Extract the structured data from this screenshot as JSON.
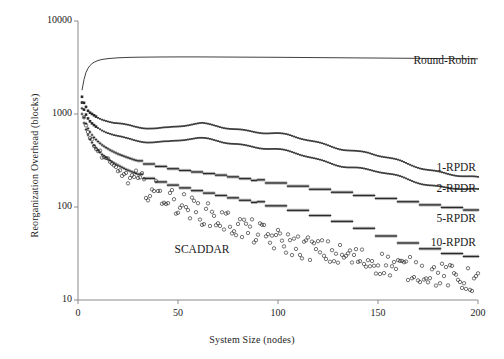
{
  "chart_data": {
    "type": "scatter",
    "title": "",
    "xlabel": "System Size (nodes)",
    "ylabel": "Reorganization Overhead (blocks)",
    "xlim": [
      0,
      200
    ],
    "ylim": [
      10,
      10000
    ],
    "yscale": "log",
    "xscale": "linear",
    "grid": false,
    "legend_position": "inline-right",
    "xticks": [
      0,
      50,
      100,
      150,
      200
    ],
    "xtick_labels": [
      "0",
      "50",
      "100",
      "150",
      "200"
    ],
    "yticks": [
      10,
      100,
      1000,
      10000
    ],
    "ytick_labels": [
      "10",
      "100",
      "1000",
      "10000"
    ],
    "series": [
      {
        "name": "Round-Robin",
        "marker": "line",
        "label_x": 208,
        "label_y": 3600,
        "x": [
          2,
          3,
          4,
          5,
          6,
          7,
          8,
          10,
          12,
          15,
          20,
          25,
          30,
          40,
          50,
          60,
          70,
          80,
          90,
          100,
          110,
          120,
          130,
          140,
          150,
          160,
          170,
          180,
          190,
          200
        ],
        "y": [
          1800,
          2350,
          2800,
          3100,
          3320,
          3480,
          3600,
          3760,
          3860,
          3940,
          4020,
          4060,
          4080,
          4100,
          4110,
          4110,
          4100,
          4090,
          4080,
          4070,
          4055,
          4040,
          4025,
          4010,
          3995,
          3980,
          3965,
          3950,
          3935,
          3920
        ]
      },
      {
        "name": "1-RPDR",
        "marker": "filled-square-small",
        "label_x": 204,
        "label_y": 255,
        "x": [
          2,
          3,
          4,
          5,
          6,
          7,
          8,
          9,
          10,
          12,
          14,
          16,
          18,
          20,
          24,
          28,
          32,
          36,
          40,
          45,
          50,
          55,
          60,
          62,
          65,
          70,
          75,
          80,
          85,
          90,
          95,
          100,
          105,
          110,
          115,
          120,
          125,
          130,
          135,
          140,
          145,
          150,
          155,
          160,
          165,
          170,
          175,
          180,
          185,
          190,
          195,
          200
        ],
        "y": [
          1500,
          1280,
          1150,
          1040,
          990,
          960,
          930,
          905,
          880,
          850,
          830,
          810,
          790,
          780,
          760,
          745,
          740,
          735,
          720,
          715,
          730,
          745,
          760,
          765,
          755,
          740,
          720,
          700,
          675,
          650,
          625,
          600,
          575,
          545,
          520,
          495,
          470,
          445,
          420,
          395,
          375,
          350,
          330,
          310,
          290,
          275,
          260,
          245,
          230,
          218,
          208,
          200
        ]
      },
      {
        "name": "2-RPDR",
        "marker": "filled-square-small",
        "label_x": 204,
        "label_y": 152,
        "x": [
          2,
          3,
          4,
          5,
          6,
          7,
          8,
          9,
          10,
          12,
          14,
          16,
          18,
          20,
          24,
          28,
          32,
          36,
          40,
          45,
          50,
          55,
          60,
          65,
          70,
          75,
          80,
          85,
          90,
          95,
          100,
          105,
          110,
          115,
          120,
          125,
          130,
          135,
          140,
          145,
          150,
          155,
          160,
          165,
          170,
          175,
          180,
          185,
          190,
          195,
          200
        ],
        "y": [
          1300,
          1080,
          950,
          860,
          800,
          760,
          730,
          705,
          685,
          650,
          625,
          605,
          585,
          570,
          545,
          530,
          525,
          520,
          512,
          505,
          515,
          525,
          530,
          525,
          515,
          500,
          485,
          465,
          445,
          425,
          405,
          385,
          365,
          345,
          325,
          308,
          292,
          276,
          262,
          248,
          235,
          222,
          210,
          198,
          188,
          178,
          170,
          163,
          158,
          152,
          148
        ]
      },
      {
        "name": "5-RPDR",
        "marker": "cross-dense",
        "label_x": 204,
        "label_y": 72,
        "x": [
          2,
          3,
          4,
          5,
          6,
          7,
          8,
          9,
          10,
          12,
          14,
          16,
          18,
          20,
          24,
          28,
          32,
          36,
          40,
          44,
          48,
          52,
          56,
          60,
          64,
          68,
          72,
          76,
          80,
          84,
          88,
          92,
          96,
          100,
          104,
          108,
          112,
          116,
          120,
          124,
          128,
          132,
          136,
          140,
          144,
          148,
          152,
          156,
          160,
          165,
          170,
          175,
          180,
          185,
          190,
          195,
          200
        ],
        "y": [
          1150,
          920,
          790,
          700,
          640,
          595,
          560,
          530,
          505,
          465,
          435,
          410,
          390,
          372,
          345,
          322,
          305,
          290,
          278,
          268,
          258,
          250,
          244,
          238,
          232,
          226,
          220,
          214,
          208,
          202,
          196,
          190,
          185,
          180,
          175,
          170,
          165,
          160,
          156,
          152,
          148,
          144,
          140,
          136,
          132,
          128,
          125,
          122,
          118,
          114,
          110,
          106,
          103,
          100,
          97,
          94,
          92
        ]
      },
      {
        "name": "10-RPDR",
        "marker": "cross-dense",
        "label_x": 204,
        "label_y": 40,
        "x": [
          2,
          3,
          4,
          5,
          6,
          7,
          8,
          9,
          10,
          12,
          14,
          16,
          18,
          20,
          24,
          28,
          32,
          36,
          40,
          44,
          48,
          52,
          56,
          60,
          64,
          68,
          72,
          76,
          80,
          84,
          88,
          92,
          96,
          100,
          104,
          108,
          112,
          116,
          120,
          124,
          128,
          132,
          136,
          140,
          145,
          150,
          155,
          160,
          165,
          170,
          175,
          180,
          185,
          190,
          195,
          200
        ],
        "y": [
          1000,
          800,
          680,
          595,
          535,
          492,
          458,
          430,
          406,
          368,
          340,
          316,
          297,
          281,
          254,
          234,
          217,
          203,
          191,
          181,
          172,
          164,
          157,
          150,
          144,
          138,
          133,
          128,
          123,
          118,
          114,
          110,
          106,
          102,
          98,
          94,
          90,
          86,
          82,
          78,
          74,
          70,
          66,
          62,
          57,
          52,
          48,
          44,
          41,
          38,
          36,
          34,
          32,
          31,
          30,
          29
        ]
      },
      {
        "name": "SCADDAR",
        "marker": "open-circle",
        "label_x": 62,
        "label_y": 34,
        "x": [
          3,
          4,
          5,
          6,
          7,
          8,
          9,
          10,
          11,
          12,
          13,
          14,
          15,
          16,
          17,
          18,
          19,
          20,
          22,
          24,
          26,
          28,
          30,
          32,
          34,
          36,
          38,
          40,
          42,
          44,
          46,
          48,
          50,
          52,
          54,
          56,
          58,
          60,
          62,
          64,
          66,
          68,
          70,
          72,
          74,
          76,
          78,
          80,
          82,
          84,
          86,
          88,
          90,
          92,
          94,
          96,
          98,
          100,
          104,
          108,
          112,
          116,
          120,
          124,
          128,
          132,
          136,
          140,
          144,
          148,
          152,
          156,
          160,
          164,
          168,
          172,
          176,
          180,
          184,
          188,
          192,
          196,
          200
        ],
        "y": [
          900,
          740,
          640,
          565,
          510,
          468,
          432,
          402,
          378,
          356,
          338,
          320,
          305,
          292,
          278,
          268,
          257,
          248,
          230,
          215,
          200,
          188,
          177,
          168,
          158,
          150,
          143,
          136,
          130,
          124,
          118,
          113,
          108,
          104,
          99,
          95,
          91,
          88,
          84,
          81,
          78,
          75,
          72,
          70,
          67,
          65,
          62,
          60,
          58,
          56,
          54,
          52,
          50,
          49,
          47,
          45,
          44,
          42,
          40,
          38,
          36,
          35,
          33,
          32,
          30,
          29,
          28,
          27,
          26,
          25,
          24,
          23,
          22,
          21,
          21,
          20,
          19,
          18,
          18,
          17,
          16,
          16,
          15
        ]
      }
    ]
  },
  "labels": {
    "round_robin": "Round-Robin",
    "rpdr1": "1-RPDR",
    "rpdr2": "2-RPDR",
    "rpdr5": "5-RPDR",
    "rpdr10": "10-RPDR",
    "scaddar": "SCADDAR"
  },
  "axes": {
    "y_title": "Reorganization Overhead (blocks)",
    "x_title": "System Size (nodes)",
    "y_tick_10000": "10000",
    "y_tick_1000": "1000",
    "y_tick_100": "100",
    "y_tick_10": "10",
    "x_tick_0": "0",
    "x_tick_50": "50",
    "x_tick_100": "100",
    "x_tick_150": "150",
    "x_tick_200": "200"
  },
  "style": {
    "axis_color": "#8a8a8a",
    "data_color": "#2a2a2a",
    "text_color": "#1a1a1a",
    "background": "#ffffff"
  }
}
